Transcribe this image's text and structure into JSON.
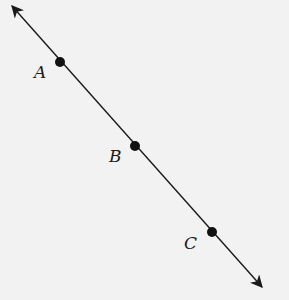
{
  "diagram": {
    "type": "line",
    "colors": {
      "background": "#f2f2f2",
      "stroke": "#1a1a1a"
    },
    "line": {
      "x1": 12,
      "y1": 6,
      "x2": 262,
      "y2": 287,
      "arrows": "both"
    },
    "points": [
      {
        "label": "A",
        "x": 60,
        "y": 62,
        "label_x": 34,
        "label_y": 64
      },
      {
        "label": "B",
        "x": 135,
        "y": 146,
        "label_x": 109,
        "label_y": 148
      },
      {
        "label": "C",
        "x": 212,
        "y": 232,
        "label_x": 184,
        "label_y": 235
      }
    ]
  }
}
